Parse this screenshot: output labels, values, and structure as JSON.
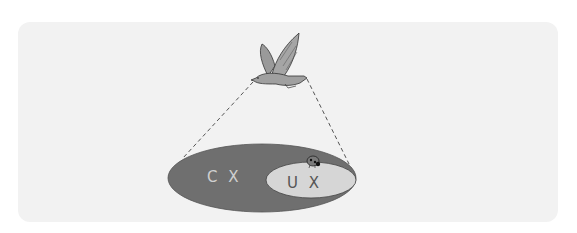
{
  "diagram": {
    "outer_ellipse": {
      "label": "C X",
      "color": "#6f6f6f"
    },
    "inner_ellipse": {
      "label": "U X",
      "color": "#d6d6d6"
    },
    "observer": "bird-icon",
    "background_color": "#f2f2f2"
  }
}
